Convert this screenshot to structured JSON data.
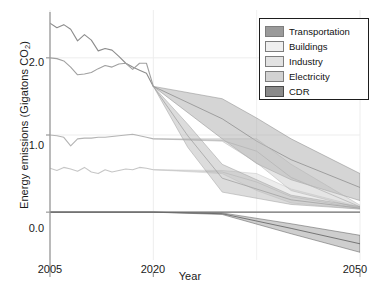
{
  "chart_data": {
    "type": "area",
    "title": "",
    "xlabel": "Year",
    "ylabel": "Energy emissions (Gigatons CO2)",
    "ylabel_display": "Energy emissions (Gigatons CO",
    "ylabel_sub": "2",
    "ylabel_tail": ")",
    "xlim": [
      2005,
      2050
    ],
    "ylim": [
      -0.62,
      2.62
    ],
    "xticks": [
      2005,
      2020,
      2050
    ],
    "xticklabels": [
      "2005",
      "2020",
      "2050"
    ],
    "yticks": [
      0.0,
      1.0,
      2.0
    ],
    "yticklabels": [
      "0.0",
      "1.0",
      "2.0"
    ],
    "grid": "faint vertical and horizontal gridlines",
    "legend_position": "upper right",
    "zero_line": true,
    "historical_end_year": 2020,
    "series": [
      {
        "name": "Transportation",
        "color": "#8c8c8c",
        "band_color": "#9a9a9a",
        "historical_x": [
          2005,
          2006,
          2007,
          2008,
          2009,
          2010,
          2011,
          2012,
          2013,
          2014,
          2015,
          2016,
          2017,
          2018,
          2019,
          2020
        ],
        "historical_y": [
          2.45,
          2.39,
          2.43,
          2.37,
          2.22,
          2.3,
          2.23,
          2.09,
          2.12,
          2.1,
          2.02,
          1.93,
          1.88,
          1.84,
          1.8,
          1.63
        ],
        "projection_x": [
          2020,
          2030,
          2035,
          2040,
          2050
        ],
        "projection_low": [
          1.63,
          0.95,
          0.63,
          0.42,
          0.15
        ],
        "projection_high": [
          1.63,
          1.47,
          1.22,
          0.95,
          0.5
        ],
        "projection_mid": [
          1.63,
          1.21,
          0.92,
          0.68,
          0.32
        ]
      },
      {
        "name": "Buildings",
        "color": "#c6c6c6",
        "band_color": "#d4d4d4",
        "historical_x": [
          2005,
          2006,
          2007,
          2008,
          2009,
          2010,
          2011,
          2012,
          2013,
          2014,
          2015,
          2016,
          2017,
          2018,
          2019,
          2020
        ],
        "historical_y": [
          0.57,
          0.54,
          0.58,
          0.56,
          0.53,
          0.58,
          0.52,
          0.5,
          0.55,
          0.52,
          0.54,
          0.56,
          0.55,
          0.58,
          0.57,
          0.55
        ],
        "projection_x": [
          2020,
          2030,
          2035,
          2040,
          2050
        ],
        "projection_low": [
          0.55,
          0.5,
          0.28,
          0.12,
          0.04
        ],
        "projection_high": [
          0.55,
          0.54,
          0.5,
          0.3,
          0.07
        ],
        "projection_mid": [
          0.55,
          0.52,
          0.39,
          0.2,
          0.05
        ]
      },
      {
        "name": "Industry",
        "color": "#b4b4b4",
        "band_color": "#c0c0c0",
        "historical_x": [
          2005,
          2006,
          2007,
          2008,
          2009,
          2010,
          2011,
          2012,
          2013,
          2014,
          2015,
          2016,
          2017,
          2018,
          2019,
          2020
        ],
        "historical_y": [
          1.0,
          0.99,
          0.97,
          0.86,
          0.95,
          0.96,
          0.96,
          0.97,
          0.97,
          0.98,
          0.99,
          1.0,
          1.01,
          0.99,
          0.97,
          0.95
        ],
        "projection_x": [
          2020,
          2030,
          2035,
          2040,
          2050
        ],
        "projection_low": [
          0.95,
          0.92,
          0.64,
          0.28,
          0.05
        ],
        "projection_high": [
          0.95,
          0.95,
          0.95,
          0.62,
          0.09
        ],
        "projection_mid": [
          0.95,
          0.93,
          0.79,
          0.45,
          0.07
        ]
      },
      {
        "name": "Electricity",
        "color": "#a0a0a0",
        "band_color": "#ababab",
        "historical_x": [
          2005,
          2006,
          2007,
          2008,
          2009,
          2010,
          2011,
          2012,
          2013,
          2014,
          2015,
          2016,
          2017,
          2018,
          2019,
          2020
        ],
        "historical_y": [
          2.0,
          1.99,
          1.96,
          1.88,
          1.78,
          1.79,
          1.81,
          1.86,
          1.9,
          1.88,
          1.92,
          1.93,
          1.85,
          1.93,
          1.93,
          1.63
        ],
        "projection_x": [
          2020,
          2025,
          2030,
          2040,
          2050
        ],
        "projection_low": [
          1.63,
          0.84,
          0.26,
          0.1,
          0.04
        ],
        "projection_high": [
          1.63,
          1.14,
          0.62,
          0.22,
          0.07
        ],
        "projection_mid": [
          1.63,
          0.99,
          0.44,
          0.16,
          0.05
        ]
      },
      {
        "name": "CDR",
        "color": "#5a5a5a",
        "band_color": "#8a8a8a",
        "historical_x": [
          2005,
          2020
        ],
        "historical_y": [
          0.0,
          0.0
        ],
        "projection_x": [
          2020,
          2030,
          2040,
          2050
        ],
        "projection_low": [
          0.0,
          -0.03,
          -0.28,
          -0.52
        ],
        "projection_high": [
          0.0,
          -0.01,
          -0.15,
          -0.3
        ],
        "projection_mid": [
          0.0,
          -0.02,
          -0.21,
          -0.41
        ]
      }
    ]
  },
  "legend": {
    "items": [
      {
        "label": "Transportation",
        "color": "#9a9a9a"
      },
      {
        "label": "Buildings",
        "color": "#efefef"
      },
      {
        "label": "Industry",
        "color": "#e2e2e2"
      },
      {
        "label": "Electricity",
        "color": "#d2d2d2"
      },
      {
        "label": "CDR",
        "color": "#8a8a8a"
      }
    ]
  },
  "axes": {
    "x_tick_labels": [
      "2005",
      "2020",
      "2050"
    ],
    "y_tick_labels": [
      "0.0",
      "1.0",
      "2.0"
    ],
    "x_title": "Year"
  }
}
